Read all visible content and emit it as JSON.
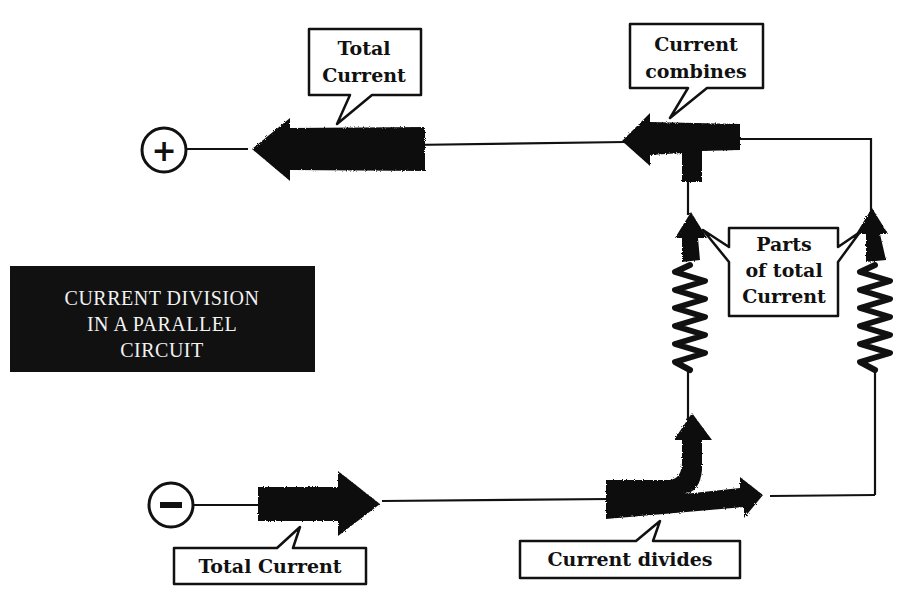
{
  "title": {
    "lines": [
      "CURRENT DIVISION",
      "IN A PARALLEL",
      "CIRCUIT"
    ]
  },
  "terminals": {
    "positive": "+",
    "negative": "−"
  },
  "callouts": {
    "top_total_current": {
      "lines": [
        "Total",
        "Current"
      ]
    },
    "current_combines": {
      "lines": [
        "Current",
        "combines"
      ]
    },
    "parts_of_total": {
      "lines": [
        "Parts",
        "of total",
        "Current"
      ]
    },
    "bottom_total_current": {
      "lines": [
        "Total Current"
      ]
    },
    "current_divides": {
      "lines": [
        "Current divides"
      ]
    }
  },
  "colors": {
    "ink": "#111111",
    "background": "#ffffff",
    "title_bg": "#111111",
    "title_text": "#f2f2f2"
  }
}
